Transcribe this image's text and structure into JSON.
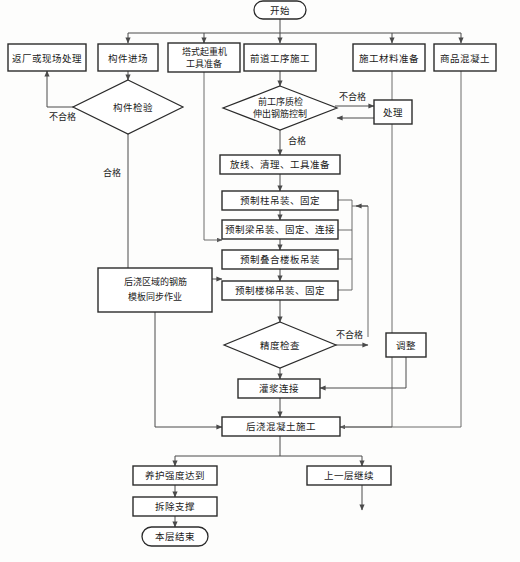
{
  "diagram": {
    "bg_color": "#fdfdfc",
    "line_color": "#4a4a4a",
    "text_color": "#1a1a1a",
    "nodes": {
      "start": "开始",
      "return_factory": "返厂或现场处理",
      "component_arrival": "构件进场",
      "tower_crane_l1": "塔式起重机",
      "tower_crane_l2": "工具准备",
      "prev_process": "前道工序施工",
      "material_prep": "施工材料准备",
      "ready_concrete": "商品混凝土",
      "component_inspect": "构件检验",
      "quality_check_l1": "前工序质检",
      "quality_check_l2": "伸出钢筋控制",
      "handle": "处理",
      "layout_clean_tools": "放线、清理、工具准备",
      "precast_column": "预制柱吊装、固定",
      "precast_beam": "预制梁吊装、固定、连接",
      "precast_slab": "预制叠合楼板吊装",
      "precast_stair": "预制楼梯吊装、固定",
      "rebar_formwork_l1": "后浇区域的钢筋",
      "rebar_formwork_l2": "模板同步作业",
      "accuracy_check": "精度检查",
      "adjust": "调整",
      "grout_connect": "灌浆连接",
      "post_cast_concrete": "后浇混凝土施工",
      "curing_strength": "养护强度达到",
      "remove_support": "拆除支撑",
      "layer_end": "本层结束",
      "next_layer": "上一层继续"
    },
    "edge_labels": {
      "fail_component": "不合格",
      "pass_component": "合格",
      "fail_quality": "不合格",
      "pass_quality": "合格",
      "fail_accuracy": "不合格"
    },
    "caption": ""
  }
}
